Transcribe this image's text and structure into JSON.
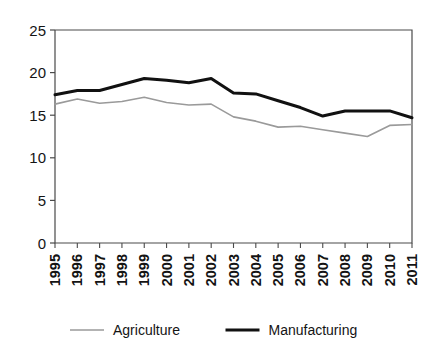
{
  "chart_data": {
    "type": "line",
    "title": "",
    "subtitle": "",
    "xlabel": "",
    "ylabel": "",
    "categories": [
      "1995",
      "1996",
      "1997",
      "1998",
      "1999",
      "2000",
      "2001",
      "2002",
      "2003",
      "2004",
      "2005",
      "2006",
      "2007",
      "2008",
      "2009",
      "2010",
      "2011"
    ],
    "x": [
      1995,
      1996,
      1997,
      1998,
      1999,
      2000,
      2001,
      2002,
      2003,
      2004,
      2005,
      2006,
      2007,
      2008,
      2009,
      2010,
      2011
    ],
    "series": [
      {
        "name": "Agriculture",
        "color": "#9a9a9a",
        "line_width": 1.6,
        "values": [
          16.3,
          16.9,
          16.4,
          16.6,
          17.1,
          16.5,
          16.2,
          16.3,
          14.8,
          14.3,
          13.6,
          13.7,
          13.3,
          12.9,
          12.5,
          13.8,
          13.9
        ]
      },
      {
        "name": "Manufacturing",
        "color": "#111111",
        "line_width": 3.0,
        "values": [
          17.4,
          17.9,
          17.9,
          18.6,
          19.3,
          19.1,
          18.8,
          19.3,
          17.6,
          17.5,
          16.7,
          15.9,
          14.9,
          15.5,
          15.5,
          15.5,
          14.7
        ]
      }
    ],
    "ylim": [
      0,
      25
    ],
    "yticks": [
      0,
      5,
      10,
      15,
      20,
      25
    ],
    "ytick_labels": [
      "0",
      "5",
      "10",
      "15",
      "20",
      "25"
    ],
    "grid": false,
    "legend_position": "bottom",
    "legend": [
      {
        "label": "Agriculture",
        "color": "#9a9a9a",
        "line_width": 1.6
      },
      {
        "label": "Manufacturing",
        "color": "#111111",
        "line_width": 3.0
      }
    ]
  },
  "axes": {
    "y_axis_name": "value-axis",
    "x_axis_name": "year-axis"
  }
}
